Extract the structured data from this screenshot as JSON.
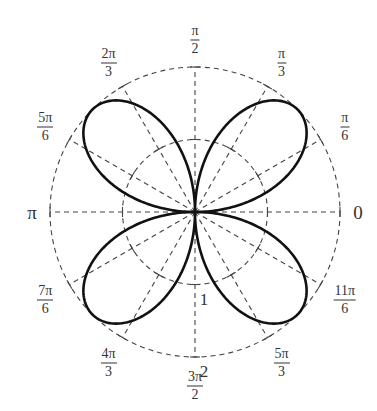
{
  "chart_data": {
    "type": "polar-line",
    "title": "",
    "equation": "r = 2 sin(2θ)",
    "curve": "four-leaved rose",
    "center_px": [
      195,
      212
    ],
    "unit_px": 72.5,
    "radial_grid": [
      1,
      2
    ],
    "radial_labels": [
      "1",
      "2"
    ],
    "angular_grid_step": "π/6",
    "grid_style": "dashed",
    "angle_labels": [
      {
        "deg": 0,
        "num": "0",
        "den": ""
      },
      {
        "deg": 30,
        "num": "π",
        "den": "6"
      },
      {
        "deg": 60,
        "num": "π",
        "den": "3"
      },
      {
        "deg": 90,
        "num": "π",
        "den": "2"
      },
      {
        "deg": 120,
        "num": "2π",
        "den": "3"
      },
      {
        "deg": 150,
        "num": "5π",
        "den": "6"
      },
      {
        "deg": 180,
        "num": "π",
        "den": ""
      },
      {
        "deg": 210,
        "num": "7π",
        "den": "6"
      },
      {
        "deg": 240,
        "num": "4π",
        "den": "3"
      },
      {
        "deg": 270,
        "num": "3π",
        "den": "2"
      },
      {
        "deg": 300,
        "num": "5π",
        "den": "3"
      },
      {
        "deg": 330,
        "num": "11π",
        "den": "6"
      }
    ],
    "r_max": 2,
    "petals": 4,
    "petal_tips_deg": [
      45,
      135,
      225,
      315
    ]
  },
  "colors": {
    "curve": "#111111",
    "grid": "#444444",
    "text": "#333333"
  }
}
